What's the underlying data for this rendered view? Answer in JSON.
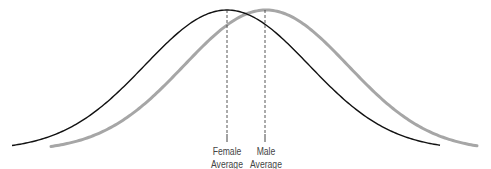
{
  "diagram": {
    "title": "",
    "curves": [
      {
        "name": "Female distribution",
        "color": "#111111",
        "stroke_width": 1.4,
        "start_x": 12,
        "end_x": 440,
        "peak_x": 227
      },
      {
        "name": "Male distribution",
        "color": "#a6a6a6",
        "stroke_width": 3,
        "start_x": 51,
        "end_x": 478,
        "peak_x": 266
      }
    ],
    "labels": {
      "female": {
        "line1": "Female",
        "line2": "Average"
      },
      "male": {
        "line1": "Male",
        "line2": "Average"
      }
    }
  },
  "chart_data": {
    "type": "line",
    "title": "",
    "xlabel": "",
    "ylabel": "",
    "series": [
      {
        "name": "Female",
        "mean_px": 227
      },
      {
        "name": "Male",
        "mean_px": 266
      }
    ],
    "annotations": [
      "Female Average",
      "Male Average"
    ],
    "grid": false
  }
}
